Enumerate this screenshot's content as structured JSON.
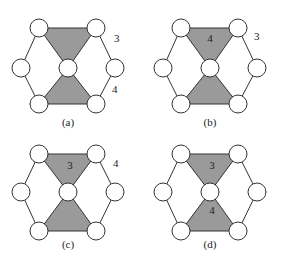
{
  "diagram": {
    "type": "hexagonal-graph-panels",
    "colors": {
      "shade": "#9a9a9a",
      "stroke": "#333333",
      "node_fill": "#ffffff"
    },
    "panels": [
      {
        "caption": "(a)",
        "upper_triangle_label": "",
        "lower_triangle_label": "",
        "outer_label_top": "3",
        "outer_label_bottom": "4"
      },
      {
        "caption": "(b)",
        "upper_triangle_label": "4",
        "lower_triangle_label": "",
        "outer_label_top": "3",
        "outer_label_bottom": ""
      },
      {
        "caption": "(c)",
        "upper_triangle_label": "3",
        "lower_triangle_label": "",
        "outer_label_top": "4",
        "outer_label_bottom": ""
      },
      {
        "caption": "(d)",
        "upper_triangle_label": "3",
        "lower_triangle_label": "4",
        "outer_label_top": "",
        "outer_label_bottom": ""
      }
    ]
  }
}
